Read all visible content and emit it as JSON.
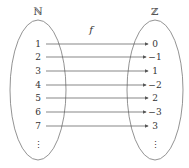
{
  "diagram": {
    "domain_label": "ℕ",
    "codomain_label": "ℤ",
    "function_label": "f",
    "mappings": [
      {
        "from": "1",
        "to": "0"
      },
      {
        "from": "2",
        "to": "−1"
      },
      {
        "from": "3",
        "to": "1"
      },
      {
        "from": "4",
        "to": "−2"
      },
      {
        "from": "5",
        "to": "2"
      },
      {
        "from": "6",
        "to": "−3"
      },
      {
        "from": "7",
        "to": "3"
      }
    ],
    "ellipsis": "⋮",
    "colors": {
      "stroke": "#555555",
      "text": "#333333"
    }
  }
}
